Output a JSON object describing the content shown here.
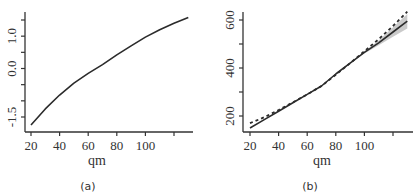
{
  "chart_data": [
    {
      "panel": "(a)",
      "type": "line",
      "title": "",
      "xlabel": "qm",
      "ylabel": "",
      "xlim": [
        18,
        132
      ],
      "ylim": [
        -1.75,
        1.65
      ],
      "x_ticks": [
        20,
        40,
        60,
        80,
        100,
        120
      ],
      "x_tick_labels": [
        "20",
        "40",
        "60",
        "80",
        "100",
        ""
      ],
      "y_ticks": [
        -1.5,
        -1.0,
        -0.5,
        0.0,
        0.5,
        1.0,
        1.5
      ],
      "y_tick_labels": [
        "-1.5",
        "",
        "",
        "0.0",
        "",
        "1.0",
        ""
      ],
      "grid": false,
      "series": [
        {
          "name": "fit",
          "style": "solid",
          "x": [
            20,
            30,
            40,
            50,
            60,
            70,
            80,
            90,
            100,
            110,
            120,
            130
          ],
          "y": [
            -1.75,
            -1.25,
            -0.82,
            -0.45,
            -0.15,
            0.12,
            0.42,
            0.7,
            0.97,
            1.2,
            1.4,
            1.58
          ]
        }
      ]
    },
    {
      "panel": "(b)",
      "type": "line",
      "title": "",
      "xlabel": "qm",
      "ylabel": "",
      "xlim": [
        18,
        132
      ],
      "ylim": [
        130,
        650
      ],
      "x_ticks": [
        20,
        40,
        60,
        80,
        100,
        120
      ],
      "x_tick_labels": [
        "20",
        "40",
        "60",
        "80",
        "100",
        ""
      ],
      "y_ticks": [
        200,
        300,
        400,
        500,
        600
      ],
      "y_tick_labels": [
        "200",
        "",
        "400",
        "",
        "600"
      ],
      "grid": false,
      "series": [
        {
          "name": "fit",
          "style": "solid",
          "x": [
            20,
            30,
            40,
            50,
            60,
            70,
            80,
            90,
            100,
            110,
            120,
            130
          ],
          "y": [
            150,
            185,
            220,
            255,
            290,
            325,
            375,
            420,
            465,
            505,
            550,
            595
          ]
        },
        {
          "name": "reference",
          "style": "dashed",
          "x": [
            20,
            30,
            40,
            50,
            60,
            70,
            80,
            90,
            100,
            110,
            120,
            130
          ],
          "y": [
            170,
            195,
            225,
            257,
            290,
            325,
            372,
            420,
            470,
            520,
            575,
            635
          ]
        },
        {
          "name": "confidence band",
          "style": "band",
          "x": [
            100,
            110,
            120,
            130
          ],
          "lower": [
            460,
            495,
            530,
            565
          ],
          "upper": [
            470,
            515,
            570,
            625
          ]
        }
      ]
    }
  ],
  "panels": {
    "a": {
      "label": "(a)",
      "xlabel": "qm"
    },
    "b": {
      "label": "(b)",
      "xlabel": "qm"
    }
  },
  "colors": {
    "line": "#2b2b2b",
    "axis": "#333333",
    "band": "#bdbdbd"
  }
}
